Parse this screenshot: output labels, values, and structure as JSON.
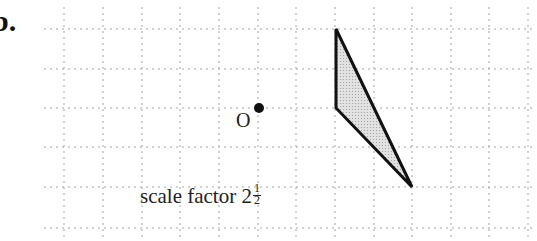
{
  "question": {
    "label": "b."
  },
  "grid": {
    "spacing_px": 39,
    "vertical_x": [
      64,
      103,
      142,
      180,
      219,
      258,
      296,
      335,
      374,
      412,
      451,
      489,
      528
    ],
    "horizontal_y": [
      29,
      69,
      108,
      147,
      187,
      228
    ],
    "line_color": "#9a9a9a",
    "style": "dotted"
  },
  "center": {
    "label": "O",
    "x": 259,
    "y": 108
  },
  "shape": {
    "type": "triangle",
    "vertices": [
      [
        336,
        29
      ],
      [
        336,
        108
      ],
      [
        412,
        187
      ]
    ],
    "fill": "#cfcfcf",
    "stroke": "#111111"
  },
  "caption": {
    "text": "scale factor 2",
    "fraction_num": "1",
    "fraction_den": "2"
  }
}
